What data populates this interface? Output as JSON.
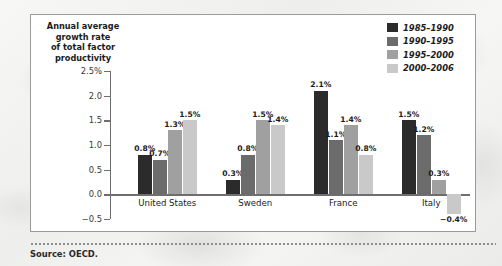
{
  "figure": {
    "axis_title_lines": [
      "Annual average",
      "growth rate",
      "of total factor",
      "productivity"
    ],
    "source_note": "Source: OECD."
  },
  "chart_data": {
    "type": "bar",
    "title": "",
    "xlabel": "",
    "ylabel": "Annual average growth rate of total factor productivity",
    "categories": [
      "United States",
      "Sweden",
      "France",
      "Italy"
    ],
    "ylim": [
      -0.5,
      2.5
    ],
    "ytick_values": [
      2.5,
      2.0,
      1.5,
      1.0,
      0.5,
      0.0,
      -0.5
    ],
    "ytick_labels": [
      "2.5%",
      "2.0",
      "1.5",
      "1.0",
      "0.5",
      "0.0",
      "-0.5"
    ],
    "grid": false,
    "legend_position": "top-right",
    "series": [
      {
        "name": "1985-1990",
        "color": "#2b2b2b",
        "values": [
          0.8,
          0.3,
          2.1,
          1.5
        ],
        "labels": [
          "0.8%",
          "0.3%",
          "2.1%",
          "1.5%"
        ]
      },
      {
        "name": "1990-1995",
        "color": "#6b6b6b",
        "values": [
          0.7,
          0.8,
          1.1,
          1.2
        ],
        "labels": [
          "0.7%",
          "0.8%",
          "1.1%",
          "1.2%"
        ]
      },
      {
        "name": "1995-2000",
        "color": "#a0a0a0",
        "values": [
          1.3,
          1.5,
          1.4,
          0.3
        ],
        "labels": [
          "1.3%",
          "1.5%",
          "1.4%",
          "0.3%"
        ]
      },
      {
        "name": "2000-2006",
        "color": "#c9c9c9",
        "values": [
          1.5,
          1.4,
          0.8,
          -0.4
        ],
        "labels": [
          "1.5%",
          "1.4%",
          "0.8%",
          "-0.4%"
        ]
      }
    ]
  }
}
